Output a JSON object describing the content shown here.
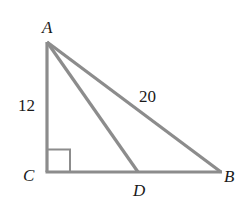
{
  "diagram": {
    "type": "right-triangle",
    "vertices": {
      "A": {
        "label": "A",
        "x": 47,
        "y": 42
      },
      "C": {
        "label": "C",
        "x": 47,
        "y": 172
      },
      "B": {
        "label": "B",
        "x": 220,
        "y": 172
      },
      "D": {
        "label": "D",
        "x": 138,
        "y": 172
      }
    },
    "segments": [
      {
        "from": "A",
        "to": "C",
        "length_label": "12"
      },
      {
        "from": "A",
        "to": "B",
        "length_label": "20"
      },
      {
        "from": "C",
        "to": "B",
        "length_label": ""
      },
      {
        "from": "A",
        "to": "D",
        "length_label": ""
      }
    ],
    "right_angle_at": "C",
    "labels": {
      "A": "A",
      "B": "B",
      "C": "C",
      "D": "D",
      "AC": "12",
      "AB": "20"
    },
    "colors": {
      "stroke": "#8c8c8c",
      "text": "#1a1a1a",
      "background": "#ffffff"
    }
  }
}
